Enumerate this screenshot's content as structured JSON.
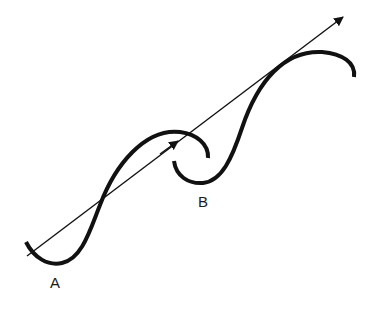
{
  "diagram": {
    "labels": {
      "a": "A",
      "b": "B"
    },
    "colors": {
      "background": "#ffffff",
      "stroke": "#111111"
    },
    "elements": [
      {
        "id": "curve-a",
        "type": "wave-curve",
        "label": "A"
      },
      {
        "id": "curve-b",
        "type": "wave-curve",
        "label": "B"
      },
      {
        "id": "arrow",
        "type": "straight-arrow",
        "direction": "up-right",
        "mid_arrowhead": true
      }
    ]
  }
}
